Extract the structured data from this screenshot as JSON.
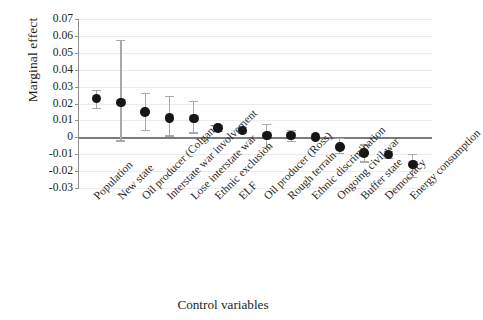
{
  "chart_data": {
    "type": "scatter",
    "title": "",
    "xlabel": "Control variables",
    "ylabel": "Marginal effect",
    "ylim": [
      -0.03,
      0.07
    ],
    "yticks": [
      "0.07",
      "0.06",
      "0.05",
      "0.04",
      "0.03",
      "0.02",
      "0.01",
      "0",
      "-0.01",
      "-0.02",
      "-0.03"
    ],
    "ytick_values": [
      0.07,
      0.06,
      0.05,
      0.04,
      0.03,
      0.02,
      0.01,
      0,
      -0.01,
      -0.02,
      -0.03
    ],
    "grid": true,
    "legend": "none",
    "error_bars": "95% confidence interval",
    "zero_reference_line": 0,
    "categories": [
      "Population",
      "New state",
      "Oil producer (Colgan)",
      "Interstate war involvement",
      "Lose interstate war",
      "Ethnic exclusion",
      "ELF",
      "Oil producer (Ross)",
      "Rough terrain",
      "Ethnic discrimination",
      "Ongoing civil war",
      "Buffer state",
      "Democracy",
      "Energy consumption"
    ],
    "values": [
      0.0228,
      0.0205,
      0.015,
      0.0115,
      0.011,
      0.0055,
      0.0042,
      0.0012,
      0.001,
      0.0001,
      -0.0058,
      -0.0093,
      -0.0102,
      -0.016
    ],
    "ci_low": [
      0.0175,
      -0.0018,
      0.0042,
      0.0012,
      0.003,
      0.004,
      0.0025,
      -0.0055,
      -0.0022,
      -0.0006,
      -0.009,
      -0.0142,
      -0.0122,
      -0.0235
    ],
    "ci_high": [
      0.028,
      0.0575,
      0.0265,
      0.0245,
      0.0215,
      0.0072,
      0.006,
      0.008,
      0.0042,
      0.0008,
      -0.0005,
      -0.0042,
      -0.008,
      -0.0098
    ],
    "colors": {
      "marker": "#161616",
      "error_bar": "#a9a9a9",
      "gridline": "#ebebeb",
      "axis": "#8e8e8e",
      "zero_line": "#7b7b7b"
    }
  }
}
